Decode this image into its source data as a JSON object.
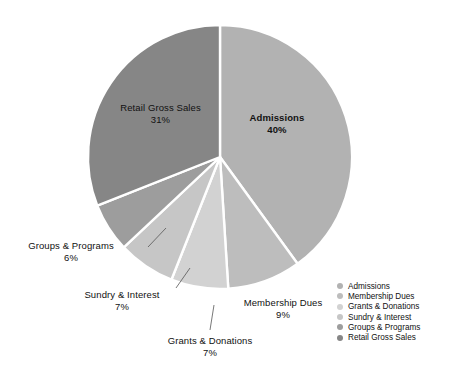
{
  "chart_data": {
    "type": "pie",
    "title": "",
    "categories": [
      "Admissions",
      "Membership Dues",
      "Grants & Donations",
      "Sundry & Interest",
      "Groups & Programs",
      "Retail Gross Sales"
    ],
    "values": [
      40,
      9,
      7,
      7,
      6,
      31
    ],
    "value_labels": [
      "40%",
      "9%",
      "7%",
      "7%",
      "6%",
      "31%"
    ],
    "units": "percent",
    "total": 100,
    "legend_position": "bottom-right",
    "grid": false,
    "start_angle_deg": 0,
    "direction": "clockwise",
    "colors": [
      "#b2b2b2",
      "#bdbdbd",
      "#d2d2d2",
      "#c6c6c6",
      "#9d9d9d",
      "#868686"
    ],
    "slice_separator_color": "#ffffff",
    "slices": [
      {
        "name": "Admissions",
        "percent": 40,
        "label": "Admissions",
        "pct_text": "40%",
        "color": "#b2b2b2",
        "bold": true,
        "leader": false
      },
      {
        "name": "Membership Dues",
        "percent": 9,
        "label": "Membership Dues",
        "pct_text": "9%",
        "color": "#bdbdbd",
        "bold": false,
        "leader": false
      },
      {
        "name": "Grants & Donations",
        "percent": 7,
        "label": "Grants & Donations",
        "pct_text": "7%",
        "color": "#d2d2d2",
        "bold": false,
        "leader": true
      },
      {
        "name": "Sundry & Interest",
        "percent": 7,
        "label": "Sundry & Interest",
        "pct_text": "7%",
        "color": "#c6c6c6",
        "bold": false,
        "leader": true
      },
      {
        "name": "Groups & Programs",
        "percent": 6,
        "label": "Groups & Programs",
        "pct_text": "6%",
        "color": "#9d9d9d",
        "bold": false,
        "leader": true
      },
      {
        "name": "Retail Gross Sales",
        "percent": 31,
        "label": "Retail Gross Sales",
        "pct_text": "31%",
        "color": "#868686",
        "bold": false,
        "leader": false
      }
    ]
  },
  "labels": {
    "admissions": {
      "name": "Admissions",
      "pct": "40%"
    },
    "retail_gross_sales": {
      "name": "Retail Gross Sales",
      "pct": "31%"
    },
    "groups_programs": {
      "name": "Groups & Programs",
      "pct": "6%"
    },
    "sundry_interest": {
      "name": "Sundry & Interest",
      "pct": "7%"
    },
    "grants_donations": {
      "name": "Grants & Donations",
      "pct": "7%"
    },
    "membership_dues": {
      "name": "Membership Dues",
      "pct": "9%"
    }
  },
  "legend": {
    "items": [
      {
        "label": "Admissions",
        "color": "#b2b2b2"
      },
      {
        "label": "Membership Dues",
        "color": "#bdbdbd"
      },
      {
        "label": "Grants & Donations",
        "color": "#d2d2d2"
      },
      {
        "label": "Sundry & Interest",
        "color": "#c6c6c6"
      },
      {
        "label": "Groups & Programs",
        "color": "#9d9d9d"
      },
      {
        "label": "Retail Gross Sales",
        "color": "#868686"
      }
    ]
  }
}
